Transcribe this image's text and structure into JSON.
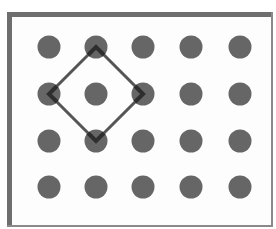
{
  "diagram": {
    "type": "dot-grid-with-diamond",
    "background": "#fdfdfd",
    "frame": {
      "color": "#6e6e6e",
      "x": 7,
      "y": 12,
      "width": 266,
      "height": 215
    },
    "grid": {
      "columns": 5,
      "rows": 4,
      "x": [
        49,
        96,
        143,
        191,
        240
      ],
      "y": [
        47,
        94,
        141,
        187
      ],
      "dot_radius": 11.5,
      "dot_color": "#666666"
    },
    "diamond": {
      "stroke": "#555555",
      "stroke_width": 3,
      "vertices": [
        {
          "col": 1,
          "row": 0
        },
        {
          "col": 2,
          "row": 1
        },
        {
          "col": 1,
          "row": 2
        },
        {
          "col": 0,
          "row": 1
        }
      ]
    }
  }
}
